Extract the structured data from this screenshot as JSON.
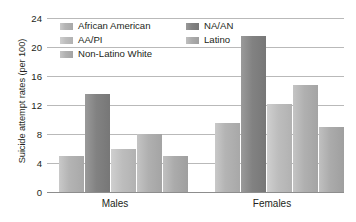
{
  "chart_data": {
    "type": "bar",
    "title": "",
    "xlabel": "",
    "ylabel": "Suicide attempt rates (per 100)",
    "categories": [
      "Males",
      "Females"
    ],
    "ylim": [
      0,
      24
    ],
    "yticks": [
      0,
      4,
      8,
      12,
      16,
      20,
      24
    ],
    "ytick_labels": [
      "0",
      "4",
      "8",
      "12",
      "16",
      "20",
      "24"
    ],
    "grid": true,
    "legend_position": "top-inside",
    "series": [
      {
        "name": "African American",
        "values": [
          5.0,
          9.5
        ],
        "color": "#b4b4b4"
      },
      {
        "name": "NA/AN",
        "values": [
          13.5,
          21.5
        ],
        "color": "#828282"
      },
      {
        "name": "AA/PI",
        "values": [
          6.0,
          12.2
        ],
        "color": "#bdbdbd"
      },
      {
        "name": "Non-Latino White",
        "values": [
          8.0,
          14.8
        ],
        "color": "#b0b0b0"
      },
      {
        "name": "Latino",
        "values": [
          5.0,
          9.0
        ],
        "color": "#ababab"
      }
    ]
  },
  "legend": {
    "column1": [
      {
        "label": "African American",
        "swatch": "fill-african-american"
      },
      {
        "label": "AA/PI",
        "swatch": "fill-aa-pi"
      },
      {
        "label": "Non-Latino White",
        "swatch": "fill-non-latino-white"
      }
    ],
    "column2": [
      {
        "label": "NA/AN",
        "swatch": "fill-na-an"
      },
      {
        "label": "Latino",
        "swatch": "fill-latino"
      }
    ]
  },
  "axis": {
    "y_title": "Suicide attempt rates (per 100)",
    "tick_24": "24",
    "tick_20": "20",
    "tick_16": "16",
    "tick_12": "12",
    "tick_8": "8",
    "tick_4": "4",
    "tick_0": "0"
  },
  "categories": {
    "males": "Males",
    "females": "Females"
  }
}
